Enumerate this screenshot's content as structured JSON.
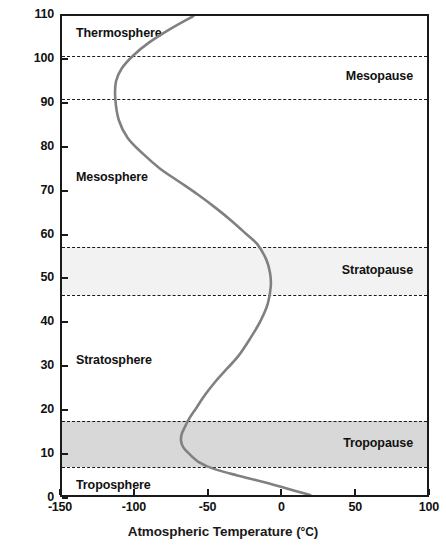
{
  "chart_data": {
    "type": "line",
    "title": "",
    "xlabel": "Atmospheric Temperature (°C)",
    "ylabel": "Height above earth's surface (km)",
    "xlim": [
      -150,
      100
    ],
    "ylim": [
      0,
      110
    ],
    "xticks": [
      "-150",
      "-100",
      "-50",
      "0",
      "50",
      "100"
    ],
    "xtick_values": [
      -150,
      -100,
      -50,
      0,
      50,
      100
    ],
    "yticks": [
      "0",
      "10",
      "20",
      "30",
      "40",
      "50",
      "60",
      "70",
      "80",
      "90",
      "100",
      "110"
    ],
    "ytick_values": [
      0,
      10,
      20,
      30,
      40,
      50,
      60,
      70,
      80,
      90,
      100,
      110
    ],
    "grid": false,
    "legend": "none",
    "series": [
      {
        "name": "Atmospheric temperature profile",
        "color": "#808080",
        "x": [
          20,
          4,
          -12,
          -30,
          -46,
          -56,
          -63,
          -67,
          -68.5,
          -68,
          -66,
          -63,
          -58,
          -52,
          -45,
          -37,
          -29,
          -21,
          -14,
          -9,
          -7,
          -7.5,
          -10,
          -16,
          -24,
          -34,
          -45,
          -57,
          -70,
          -83,
          -95,
          -105,
          -111,
          -113.5,
          -113,
          -109,
          -101,
          -90,
          -76,
          -60
        ],
        "y": [
          0,
          1.5,
          3,
          4.5,
          6,
          7.5,
          9.5,
          11,
          12.5,
          14,
          15.5,
          17.5,
          20,
          23,
          26,
          29,
          32,
          36,
          40,
          44,
          48,
          51,
          54,
          57.5,
          60,
          63,
          66,
          69,
          72,
          75,
          78.5,
          82,
          86,
          91,
          95,
          98,
          101,
          104,
          107,
          110
        ]
      }
    ],
    "annotations": [
      {
        "label": "Thermosphere",
        "position": "left",
        "y": 106
      },
      {
        "label": "Mesopause",
        "position": "right",
        "y": 96
      },
      {
        "label": "Mesosphere",
        "position": "left",
        "y": 73
      },
      {
        "label": "Stratopause",
        "position": "right",
        "y": 52
      },
      {
        "label": "Stratosphere",
        "position": "left",
        "y": 31.5
      },
      {
        "label": "Tropopause",
        "position": "right",
        "y": 12.5
      },
      {
        "label": "Troposphere",
        "position": "left",
        "y": 3
      }
    ],
    "bands": [
      {
        "name": "mesopause-band",
        "from": 91,
        "to": 101,
        "color": "#ffffff"
      },
      {
        "name": "stratopause-band",
        "from": 46.5,
        "to": 57.5,
        "color": "#f2f2f2"
      },
      {
        "name": "tropopause-band",
        "from": 7.3,
        "to": 17.7,
        "color": "#d8d8d8"
      }
    ],
    "dividers": [
      101,
      91,
      57.5,
      46.5,
      17.7,
      7.3
    ]
  },
  "axis": {
    "y_title": "Height above earth's surface (km)",
    "x_title_main": "Atmospheric Temperature (",
    "x_title_unit": "°C",
    "x_title_end": ")"
  }
}
